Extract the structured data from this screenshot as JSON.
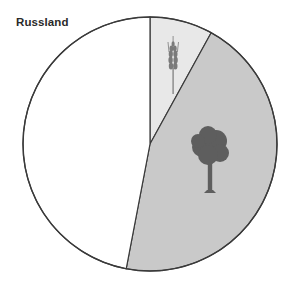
{
  "chart_data": {
    "type": "pie",
    "title": "Russland",
    "start_angle_deg": 0,
    "direction": "clockwise",
    "slices": [
      {
        "label": "Ackerland",
        "icon": "wheat-icon",
        "value": 8,
        "color": "#e8e8e8"
      },
      {
        "label": "Wald",
        "icon": "tree-icon",
        "value": 45,
        "color": "#c9c9c9"
      },
      {
        "label": "Sonstige",
        "icon": "",
        "value": 47,
        "color": "#ffffff"
      }
    ],
    "legend": "none",
    "stroke_color": "#3a3a3a"
  },
  "header": {
    "cut_off_text": ""
  }
}
